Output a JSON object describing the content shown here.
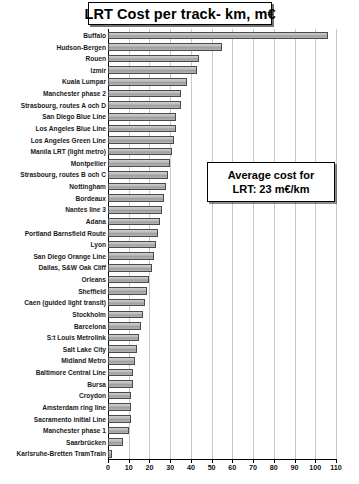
{
  "chart_data": {
    "type": "bar",
    "orientation": "horizontal",
    "title": "LRT Cost per track- km, m€",
    "xlabel": "",
    "ylabel": "",
    "xlim": [
      0,
      110
    ],
    "xticks": [
      0,
      10,
      20,
      30,
      40,
      50,
      60,
      70,
      80,
      90,
      100,
      110
    ],
    "grid": true,
    "legend": null,
    "annotations": [
      {
        "line1": "Average cost for",
        "line2": "LRT: 23 m€/km",
        "text": "Average cost for LRT: 23 m€/km"
      }
    ],
    "categories": [
      "Buffalo",
      "Hudson-Bergen",
      "Rouen",
      "Izmir",
      "Kuala Lumpar",
      "Manchester phase 2",
      "Strasbourg, routes A och D",
      "San Diego Blue Line",
      "Los Angeles Blue Line",
      "Los Angeles Green Line",
      "Manila LRT (light metro)",
      "Montpellier",
      "Strasbourg, routes B och C",
      "Nottingham",
      "Bordeaux",
      "Nantes line 3",
      "Adana",
      "Portland Barnsfield Route",
      "Lyon",
      "San Diego Orange Line",
      "Dallas, S&W Oak Cliff",
      "Orleans",
      "Sheffield",
      "Caen (guided light transit)",
      "Stockholm",
      "Barcelona",
      "S:t Louis Metrolink",
      "Salt Lake City",
      "Midland Metro",
      "Baltimore Central Line",
      "Bursa",
      "Croydon",
      "Amsterdam ring line",
      "Sacramento initial Line",
      "Manchester phase 1",
      "Saarbrücken",
      "Karlsruhe-Bretten TramTrain"
    ],
    "values": [
      106,
      55,
      44,
      43,
      38,
      35,
      35,
      33,
      33,
      32,
      31,
      30,
      29,
      28,
      27,
      26,
      25,
      24,
      23,
      22,
      21,
      20,
      19,
      18,
      17,
      16,
      15,
      14,
      13,
      12,
      12,
      11,
      11,
      11,
      10,
      7,
      2
    ],
    "units": "m€"
  }
}
